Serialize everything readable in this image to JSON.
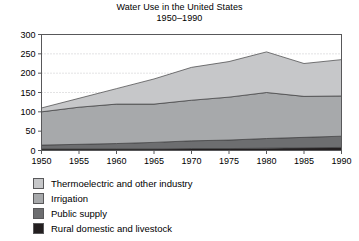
{
  "chart_data": {
    "type": "area",
    "stacked": true,
    "title": "Water Use in the United States",
    "subtitle": "1950–1990",
    "xlabel": "",
    "ylabel": "",
    "x": [
      1950,
      1955,
      1960,
      1965,
      1970,
      1975,
      1980,
      1985,
      1990
    ],
    "xtick_labels": [
      "1950",
      "1955",
      "1960",
      "1965",
      "1970",
      "1975",
      "1980",
      "1985",
      "1990"
    ],
    "xlim": [
      1950,
      1990
    ],
    "ylim": [
      0,
      300
    ],
    "yticks": [
      0,
      50,
      100,
      150,
      200,
      250,
      300
    ],
    "ytick_labels": [
      "0",
      "50",
      "100",
      "150",
      "200",
      "250",
      "300"
    ],
    "grid": "horizontal-dotted",
    "legend_position": "below-plot-left",
    "series": [
      {
        "name": "Rural domestic and livestock",
        "color": "#231f20",
        "values": [
          4,
          4,
          4,
          4,
          5,
          5,
          6,
          7,
          8
        ]
      },
      {
        "name": "Public supply",
        "color": "#6d6e70",
        "values": [
          10,
          12,
          14,
          17,
          20,
          22,
          25,
          27,
          29
        ]
      },
      {
        "name": "Irrigation",
        "color": "#a7a9ab",
        "values": [
          86,
          96,
          102,
          99,
          105,
          111,
          119,
          106,
          104
        ]
      },
      {
        "name": "Thermoelectric and other industry",
        "color": "#c6c7c9",
        "values": [
          10,
          23,
          40,
          65,
          85,
          92,
          105,
          85,
          94
        ]
      }
    ],
    "totals": [
      110,
      135,
      160,
      185,
      215,
      230,
      255,
      225,
      235
    ]
  },
  "legend": {
    "items": [
      {
        "label": "Thermoelectric and other industry",
        "color": "#c6c7c9"
      },
      {
        "label": "Irrigation",
        "color": "#a7a9ab"
      },
      {
        "label": "Public supply",
        "color": "#6d6e70"
      },
      {
        "label": "Rural domestic and livestock",
        "color": "#231f20"
      }
    ]
  },
  "axes": {
    "frame_color": "#58585a",
    "gridline_color": "#b9b9bb"
  }
}
